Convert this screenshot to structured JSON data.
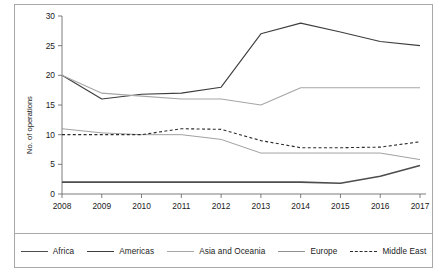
{
  "chart_data": {
    "type": "line",
    "title": "",
    "xlabel": "",
    "ylabel": "No. of operations",
    "x": [
      2008,
      2009,
      2010,
      2011,
      2012,
      2013,
      2014,
      2015,
      2016,
      2017
    ],
    "categories": [
      "2008",
      "2009",
      "2010",
      "2011",
      "2012",
      "2013",
      "2014",
      "2015",
      "2016",
      "2017"
    ],
    "xtick_labels": [
      "2008",
      "2009",
      "2010",
      "2011",
      "2012",
      "2013",
      "2014",
      "2015",
      "2016",
      "2017"
    ],
    "ytick_labels": [
      "0",
      "5",
      "10",
      "15",
      "20",
      "25",
      "30"
    ],
    "yticks": [
      0,
      5,
      10,
      15,
      20,
      25,
      30
    ],
    "ylim": [
      0,
      30
    ],
    "xlim": [
      2008,
      2017
    ],
    "grid": false,
    "legend_position": "bottom",
    "series": [
      {
        "name": "Africa",
        "values": [
          2,
          2,
          2,
          2,
          2,
          2,
          2,
          1.8,
          3,
          4.8
        ],
        "color": "#4d4d4d",
        "width": 1.6,
        "dash": "none"
      },
      {
        "name": "Americas",
        "values": [
          20,
          16,
          16.8,
          17,
          18,
          27,
          28.8,
          27.3,
          25.7,
          25
        ],
        "color": "#3d3d3d",
        "width": 1.1,
        "dash": "none"
      },
      {
        "name": "Asia and Oceania",
        "values": [
          20,
          17,
          16.5,
          16,
          16,
          15,
          17.9,
          17.9,
          17.9,
          17.9
        ],
        "color": "#a6a6a6",
        "width": 1.1,
        "dash": "none"
      },
      {
        "name": "Europe",
        "values": [
          11,
          10.3,
          10,
          10,
          9.2,
          6.9,
          6.9,
          6.9,
          6.9,
          5.8
        ],
        "color": "#909090",
        "width": 0.85,
        "dash": "none"
      },
      {
        "name": "Middle East",
        "values": [
          10,
          10,
          10,
          11,
          10.9,
          9,
          7.8,
          7.8,
          7.9,
          8.8
        ],
        "color": "#2b2b2b",
        "width": 1.1,
        "dash": "3,2.4"
      }
    ]
  },
  "legend": {
    "items": [
      {
        "label": "Africa"
      },
      {
        "label": "Americas"
      },
      {
        "label": "Asia and Oceania"
      },
      {
        "label": "Europe"
      },
      {
        "label": "Middle East"
      }
    ]
  },
  "colors": {
    "frame": "#a8a8a8",
    "axis": "#6e6e6e",
    "text": "#1a1a1a",
    "background": "#ffffff"
  }
}
